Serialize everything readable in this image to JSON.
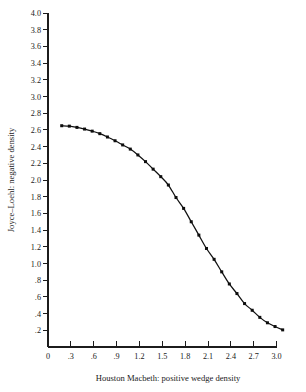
{
  "chart_data": {
    "type": "line",
    "title": "",
    "xlabel": "Houston Macbeth:  positive wedge density",
    "ylabel": "Joyce–Loehl:  negative density",
    "xlim": [
      0,
      3.15
    ],
    "ylim": [
      0,
      4.0
    ],
    "grid": false,
    "legend": null,
    "markers": "square",
    "xticks": [
      0,
      0.3,
      0.6,
      0.9,
      1.2,
      1.5,
      1.8,
      2.1,
      2.4,
      2.7,
      3.0
    ],
    "xticklabels": [
      "0",
      ".3",
      ".6",
      ".9",
      "1.2",
      "1.5",
      "1.8",
      "2.1",
      "2.4",
      "2.7",
      "3.0"
    ],
    "yticks": [
      0.2,
      0.4,
      0.6,
      0.8,
      1.0,
      1.2,
      1.4,
      1.6,
      1.8,
      2.0,
      2.2,
      2.4,
      2.6,
      2.8,
      3.0,
      3.2,
      3.4,
      3.6,
      3.8,
      4.0
    ],
    "yticklabels": [
      ".2",
      ".4",
      ".6",
      ".8",
      "1.0",
      "1.2",
      "1.4",
      "1.6",
      "1.8",
      "2.0",
      "2.2",
      "2.4",
      "2.6",
      "2.8",
      "3.0",
      "3.2",
      "3.4",
      "3.6",
      "3.8",
      "4.0"
    ],
    "series": [
      {
        "name": "wedge density response",
        "x": [
          0.18,
          0.28,
          0.38,
          0.48,
          0.58,
          0.68,
          0.78,
          0.88,
          0.98,
          1.08,
          1.18,
          1.28,
          1.38,
          1.48,
          1.58,
          1.68,
          1.78,
          1.88,
          1.98,
          2.08,
          2.18,
          2.28,
          2.38,
          2.48,
          2.58,
          2.68,
          2.78,
          2.88,
          2.98,
          3.08
        ],
        "y": [
          2.65,
          2.645,
          2.63,
          2.61,
          2.585,
          2.555,
          2.515,
          2.47,
          2.42,
          2.37,
          2.3,
          2.22,
          2.13,
          2.04,
          1.94,
          1.79,
          1.66,
          1.5,
          1.34,
          1.18,
          1.05,
          0.9,
          0.755,
          0.64,
          0.52,
          0.44,
          0.355,
          0.29,
          0.245,
          0.205
        ]
      }
    ],
    "colors": {
      "axis": "#1c1c1c",
      "curve": "#111111",
      "marker": "#0d0d0d",
      "background": "#ffffff"
    }
  },
  "geometry": {
    "plot_left": 48,
    "plot_right": 288,
    "plot_top": 13,
    "plot_bottom": 347,
    "x_min": 0,
    "x_max": 3.15,
    "y_min": 0,
    "y_max": 4.0
  }
}
